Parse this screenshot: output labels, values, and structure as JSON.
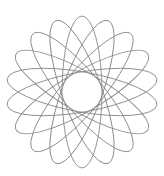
{
  "figure": {
    "type": "rotated-ellipses-rosette",
    "ellipse_count": 9,
    "center": [
      82,
      92
    ],
    "semi_major": 76,
    "semi_minor": 20,
    "start_angle_deg": 90,
    "step_angle_deg": 20,
    "stroke_color": "#8a8a8a",
    "background": "#ffffff"
  }
}
